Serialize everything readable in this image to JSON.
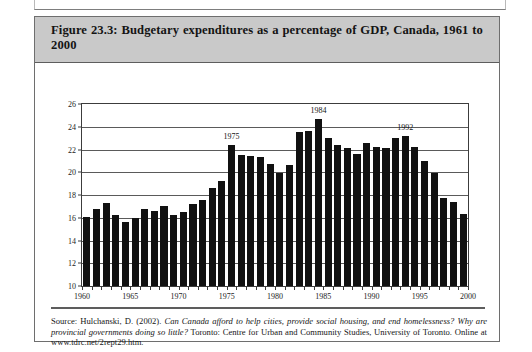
{
  "figure": {
    "caption": "Figure 23.3: Budgetary expenditures as a percentage of GDP, Canada, 1961 to 2000"
  },
  "source": {
    "lead": "Source: Hulchanski, D. (2002).",
    "title_italic": "Can Canada afford to help cities, provide social housing, and end homelessness? Why are provincial governments doing so little?",
    "publisher": "Toronto: Centre for Urban and Community Studies, University of Toronto.",
    "online": "Online at www.tdrc.net/2rept29.htm."
  },
  "colors": {
    "bar": "#111111",
    "caption_background": "#c9c9c9",
    "frame": "#3c3c3c",
    "grid": "#5a5a5a"
  },
  "chart_data": {
    "type": "bar",
    "title": "Budgetary expenditures as a percentage of GDP, Canada, 1961 to 2000",
    "xlabel": "",
    "ylabel": "",
    "ylim": [
      10,
      26
    ],
    "ytick_labels": [
      "10",
      "12",
      "14",
      "16",
      "18",
      "20",
      "22",
      "24",
      "26"
    ],
    "ytick_values": [
      10,
      12,
      14,
      16,
      18,
      20,
      22,
      24,
      26
    ],
    "xlim": [
      1960,
      2000
    ],
    "xtick_labels": [
      "1960",
      "1965",
      "1970",
      "1975",
      "1980",
      "1985",
      "1990",
      "1995",
      "2000"
    ],
    "xtick_values": [
      1960,
      1965,
      1970,
      1975,
      1980,
      1985,
      1990,
      1995,
      2000
    ],
    "minor_xticks_every": 1,
    "grid": "horizontal",
    "legend": "none",
    "categories": [
      1961,
      1962,
      1963,
      1964,
      1965,
      1966,
      1967,
      1968,
      1969,
      1970,
      1971,
      1972,
      1973,
      1974,
      1975,
      1976,
      1977,
      1978,
      1979,
      1980,
      1981,
      1982,
      1983,
      1984,
      1985,
      1986,
      1987,
      1988,
      1989,
      1990,
      1991,
      1992,
      1993,
      1994,
      1995,
      1996,
      1997,
      1998,
      1999,
      2000
    ],
    "values": [
      16.1,
      16.8,
      17.3,
      16.2,
      15.6,
      16.0,
      16.8,
      16.6,
      17.0,
      16.2,
      16.5,
      17.2,
      17.6,
      18.6,
      19.2,
      22.4,
      21.5,
      21.4,
      21.3,
      20.7,
      19.9,
      20.6,
      23.5,
      23.6,
      24.7,
      23.0,
      22.4,
      22.1,
      21.6,
      22.6,
      22.2,
      22.1,
      23.0,
      23.2,
      22.2,
      21.0,
      19.9,
      17.7,
      17.4,
      16.3
    ],
    "annotations": [
      {
        "label": "1975",
        "year": 1976,
        "value": 22.4
      },
      {
        "label": "1984",
        "year": 1985,
        "value": 24.7
      },
      {
        "label": "1992",
        "year": 1994,
        "value": 23.2
      }
    ]
  }
}
